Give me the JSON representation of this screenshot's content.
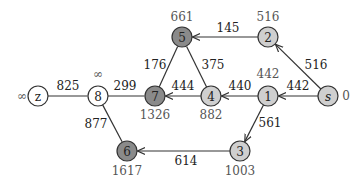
{
  "diagram": {
    "type": "shortest-path-graph",
    "colors": {
      "white": "#ffffff",
      "light": "#cfcfcf",
      "dark": "#8a8a8a",
      "stroke": "#333333",
      "text": "#222222",
      "dist_text": "#555555"
    },
    "nodes": [
      {
        "id": "z",
        "label": "z",
        "italic": false,
        "x": 38,
        "y": 96,
        "fill": "white",
        "dist": "∞",
        "dist_x": 22,
        "dist_y": 96
      },
      {
        "id": "8",
        "label": "8",
        "italic": false,
        "x": 98,
        "y": 96,
        "fill": "white",
        "dist": "∞",
        "dist_x": 98,
        "dist_y": 74
      },
      {
        "id": "7",
        "label": "7",
        "italic": false,
        "x": 155,
        "y": 96,
        "fill": "dark",
        "dist": "1326",
        "dist_x": 155,
        "dist_y": 115
      },
      {
        "id": "5",
        "label": "5",
        "italic": false,
        "x": 182,
        "y": 37,
        "fill": "dark",
        "dist": "661",
        "dist_x": 182,
        "dist_y": 17
      },
      {
        "id": "4",
        "label": "4",
        "italic": false,
        "x": 211,
        "y": 96,
        "fill": "light",
        "dist": "882",
        "dist_x": 211,
        "dist_y": 115
      },
      {
        "id": "2",
        "label": "2",
        "italic": false,
        "x": 268,
        "y": 37,
        "fill": "light",
        "dist": "516",
        "dist_x": 268,
        "dist_y": 17
      },
      {
        "id": "1",
        "label": "1",
        "italic": false,
        "x": 268,
        "y": 96,
        "fill": "light",
        "dist": "442",
        "dist_x": 268,
        "dist_y": 74
      },
      {
        "id": "s",
        "label": "s",
        "italic": true,
        "x": 328,
        "y": 96,
        "fill": "light",
        "dist": "0",
        "dist_x": 346,
        "dist_y": 96
      },
      {
        "id": "3",
        "label": "3",
        "italic": false,
        "x": 240,
        "y": 151,
        "fill": "light",
        "dist": "1003",
        "dist_x": 240,
        "dist_y": 171
      },
      {
        "id": "6",
        "label": "6",
        "italic": false,
        "x": 127,
        "y": 151,
        "fill": "dark",
        "dist": "1617",
        "dist_x": 127,
        "dist_y": 171
      }
    ],
    "edges": [
      {
        "from": "z",
        "to": "8",
        "weight": "825",
        "directed": false,
        "wx": 68,
        "wy": 86
      },
      {
        "from": "8",
        "to": "7",
        "weight": "299",
        "directed": false,
        "wx": 125,
        "wy": 86
      },
      {
        "from": "8",
        "to": "6",
        "weight": "877",
        "directed": false,
        "wx": 96,
        "wy": 124
      },
      {
        "from": "7",
        "to": "5",
        "weight": "176",
        "directed": false,
        "wx": 155,
        "wy": 65
      },
      {
        "from": "4",
        "to": "7",
        "weight": "444",
        "directed": true,
        "wx": 183,
        "wy": 86
      },
      {
        "from": "4",
        "to": "5",
        "weight": "375",
        "directed": false,
        "wx": 213,
        "wy": 65
      },
      {
        "from": "2",
        "to": "5",
        "weight": "145",
        "directed": true,
        "wx": 228,
        "wy": 28
      },
      {
        "from": "1",
        "to": "4",
        "weight": "440",
        "directed": true,
        "wx": 240,
        "wy": 86
      },
      {
        "from": "s",
        "to": "2",
        "weight": "516",
        "directed": true,
        "wx": 316,
        "wy": 65
      },
      {
        "from": "s",
        "to": "1",
        "weight": "442",
        "directed": true,
        "wx": 298,
        "wy": 86
      },
      {
        "from": "1",
        "to": "3",
        "weight": "561",
        "directed": true,
        "wx": 270,
        "wy": 123
      },
      {
        "from": "3",
        "to": "6",
        "weight": "614",
        "directed": true,
        "wx": 186,
        "wy": 161
      }
    ]
  }
}
